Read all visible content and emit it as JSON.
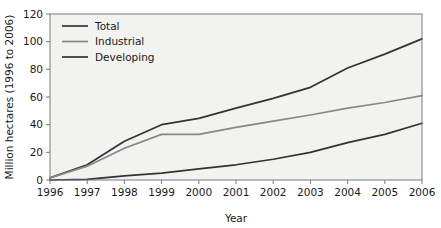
{
  "chart_data": {
    "type": "line",
    "title": "",
    "xlabel": "Year",
    "ylabel": "Million hectares (1996 to 2006)",
    "categories": [
      "1996",
      "1997",
      "1998",
      "1999",
      "2000",
      "2001",
      "2002",
      "2003",
      "2004",
      "2005",
      "2006"
    ],
    "x": [
      1996,
      1997,
      1998,
      1999,
      2000,
      2001,
      2002,
      2003,
      2004,
      2005,
      2006
    ],
    "xlim": [
      1996,
      2006
    ],
    "ylim": [
      0,
      120
    ],
    "yticks": [
      0,
      20,
      40,
      60,
      80,
      100,
      120
    ],
    "ytick_labels": [
      "0",
      "20",
      "40",
      "60",
      "80",
      "100",
      "120"
    ],
    "xtick_labels": [
      "1996",
      "1997",
      "1998",
      "1999",
      "2000",
      "2001",
      "2002",
      "2003",
      "2004",
      "2005",
      "2006"
    ],
    "grid": false,
    "legend_position": "top-left inside plot",
    "series": [
      {
        "name": "Total",
        "color": "#333333",
        "values": [
          1.5,
          11,
          28,
          40,
          44.5,
          52,
          59,
          67,
          81,
          91,
          102
        ]
      },
      {
        "name": "Industrial",
        "color": "#888888",
        "values": [
          1.5,
          10,
          23,
          33,
          33,
          38,
          42.5,
          47,
          52,
          56,
          61
        ]
      },
      {
        "name": "Developing",
        "color": "#333333",
        "values": [
          0,
          0.5,
          3,
          5,
          8,
          11,
          15,
          20,
          27,
          33,
          41
        ]
      }
    ]
  },
  "legend": {
    "items": [
      {
        "label": "Total"
      },
      {
        "label": "Industrial"
      },
      {
        "label": "Developing"
      }
    ]
  },
  "axes": {
    "y_title": "Million hectares (1996 to 2006)",
    "x_title": "Year"
  },
  "style": {
    "plot_background": "#f2f2f0",
    "page_background": "#ffffff",
    "axis_color": "#7a7a7a",
    "text_color": "#1a1a1a"
  }
}
